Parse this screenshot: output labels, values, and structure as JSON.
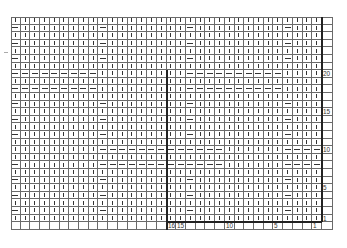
{
  "chart": {
    "columns": 32,
    "rows": 27,
    "divider_after_column_from_right": 16,
    "symbols": {
      "knit": "|",
      "purl": "—"
    },
    "row_labels": [
      {
        "row": 20,
        "text": "20"
      },
      {
        "row": 15,
        "text": "15"
      },
      {
        "row": 10,
        "text": "10"
      },
      {
        "row": 5,
        "text": "5"
      },
      {
        "row": 1,
        "text": "1"
      }
    ],
    "column_labels": [
      {
        "col": 16,
        "text": "16"
      },
      {
        "col": 15,
        "text": "15"
      },
      {
        "col": 10,
        "text": "10"
      },
      {
        "col": 5,
        "text": "5"
      },
      {
        "col": 1,
        "text": "1"
      }
    ],
    "pattern_rows_top_to_bottom": [
      "||||||||||||||||||||||||||||||||",
      "-||||||||-||||||||-|||||||||-|||",
      "||||||||||||||||||||||||||||||||",
      "-||||||||-||||||||-|||||||||-|||",
      "||||||||||||||||||||||||||||||||",
      "-||||||||-||||||||-|||||||||-|||",
      "||||||||||||||||||||||||||||||||",
      "---------|||||||||----------||||",
      "||||||||||||||||||||||||||||||||",
      "---------|||||||||----------||||",
      "||||||||||||||||||||||||||||||||",
      "-||||||||-||||||||-|||||||||-|||",
      "||||||||||||||||||||||||||||||||",
      "-||||||||-||||||||-|||||||||-|||",
      "||||||||||||||||||||||||||||||||",
      "-||||||||-||||||||-|||||||||-|||",
      "||||||||||||||||||||||||||||||||",
      "|||||||||-------------||||||----",
      "||||||||||||||||||||||||||||||||",
      "-||||||||-------------||||||----",
      "||||||||||||||||||||||||||||||||",
      "-||||||||-||||||||-|||||||||-|||",
      "||||||||||||||||||||||||||||||||",
      "-||||||||-||||||||-|||||||||-|||",
      "||||||||||||||||||||||||||||||||",
      "-||||||||-||||||||-|||||||||-|||",
      "||||||||||||||||||||||||||||||||"
    ]
  }
}
